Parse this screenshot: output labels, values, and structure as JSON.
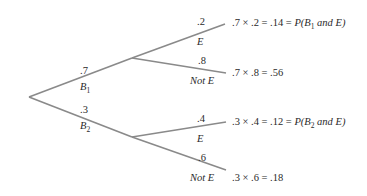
{
  "diagram": {
    "type": "probability-tree",
    "first_level": [
      {
        "prob": ".7",
        "event": "B",
        "event_sub": "1"
      },
      {
        "prob": ".3",
        "event": "B",
        "event_sub": "2"
      }
    ],
    "second_level": [
      {
        "parent": "B1",
        "prob": ".2",
        "event": "E",
        "result_expr": ".7 × .2 = .14 = ",
        "result_p": "P(B",
        "result_sub": "1",
        "result_tail": " and E)"
      },
      {
        "parent": "B1",
        "prob": ".8",
        "event": "Not E",
        "result_expr": ".7 × .8 = .56"
      },
      {
        "parent": "B2",
        "prob": ".4",
        "event": "E",
        "result_expr": ".3 × .4 = .12 = ",
        "result_p": "P(B",
        "result_sub": "2",
        "result_tail": " and E)"
      },
      {
        "parent": "B2",
        "prob": ".6",
        "event": "Not E",
        "result_expr": ".3 × .6 = .18"
      }
    ],
    "line_color": "#8a8a8a"
  }
}
